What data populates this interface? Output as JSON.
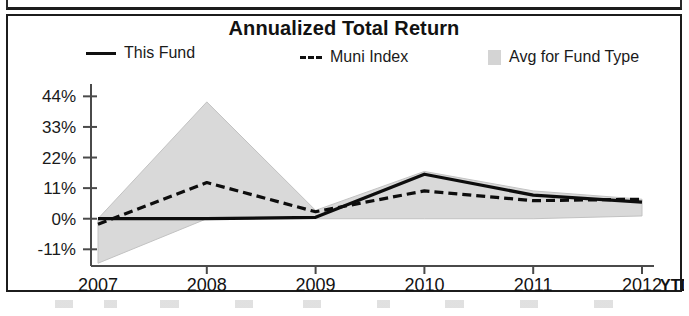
{
  "card": {
    "title": "Annualized Total Return"
  },
  "legend": {
    "items": [
      {
        "label": "This Fund",
        "marker": "solid-line",
        "color": "#0d0d0d"
      },
      {
        "label": "Muni Index",
        "marker": "dashed-line",
        "color": "#0d0d0d"
      },
      {
        "label": "Avg for Fund Type",
        "marker": "filled-box",
        "color": "#d4d4d4"
      }
    ]
  },
  "axes": {
    "y_ticks": [
      "44%",
      "33%",
      "22%",
      "11%",
      "0%",
      "-11%"
    ],
    "x_ticks": [
      "2007",
      "2008",
      "2009",
      "2010",
      "2011",
      "2012"
    ],
    "x_suffix_label": "YTD"
  },
  "chart_data": {
    "type": "line",
    "title": "Annualized Total Return",
    "xlabel": "",
    "ylabel": "",
    "categories": [
      "2007",
      "2008",
      "2009",
      "2010",
      "2011",
      "2012 YTD"
    ],
    "x_tick_labels": [
      "2007",
      "2008",
      "2009",
      "2010",
      "2011",
      "2012"
    ],
    "y_tick_labels": [
      "44%",
      "33%",
      "22%",
      "11%",
      "0%",
      "-11%"
    ],
    "y_tick_values": [
      44,
      33,
      22,
      11,
      0,
      -11
    ],
    "ylim": [
      -17,
      47
    ],
    "grid": false,
    "legend_position": "top",
    "series": [
      {
        "name": "This Fund",
        "style": "solid",
        "color": "#0d0d0d",
        "values": [
          0,
          0,
          0.5,
          16,
          8.5,
          6
        ]
      },
      {
        "name": "Muni Index",
        "style": "dashed",
        "color": "#0d0d0d",
        "values": [
          -2,
          13,
          2.5,
          10,
          6.5,
          7
        ]
      },
      {
        "name": "Avg for Fund Type",
        "style": "shaded-band",
        "color": "#d9d9d9",
        "upper": [
          0,
          42,
          3,
          17,
          10,
          7
        ],
        "lower": [
          -16,
          0,
          0,
          0,
          0,
          1
        ]
      }
    ]
  }
}
